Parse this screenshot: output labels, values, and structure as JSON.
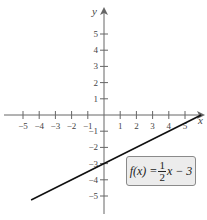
{
  "chart_data": {
    "type": "line",
    "title": "",
    "xlabel": "x",
    "ylabel": "y",
    "xlim": [
      -5,
      6
    ],
    "ylim": [
      -5,
      6
    ],
    "grid": false,
    "x_ticks": [
      -5,
      -4,
      -3,
      -2,
      -1,
      1,
      2,
      3,
      4,
      5
    ],
    "y_ticks": [
      -5,
      -4,
      -3,
      -2,
      -1,
      1,
      2,
      3,
      4,
      5
    ],
    "x_tick_labels": [
      "−5",
      "−4",
      "−3",
      "−2",
      "−1",
      "1",
      "2",
      "3",
      "4",
      "5"
    ],
    "y_tick_labels": [
      "−5",
      "−4",
      "−3",
      "−2",
      "−1",
      "1",
      "2",
      "3",
      "4",
      "5"
    ],
    "series": [
      {
        "name": "f(x) = 1/2 x − 3",
        "slope": 0.5,
        "intercept": -3,
        "x": [
          -4.5,
          6
        ],
        "y": [
          -5.25,
          0
        ],
        "color": "#111111"
      }
    ],
    "annotations": [
      {
        "text": "f(x) = 1/2 x − 3",
        "position": "lower-right"
      }
    ]
  },
  "equation": {
    "lhs": "f(x) =",
    "num": "1",
    "den": "2",
    "rhs": "x − 3"
  },
  "axes": {
    "x_label": "x",
    "y_label": "y"
  },
  "colors": {
    "axis": "#555555",
    "line": "#111111",
    "box_fill": "#ececec",
    "box_border": "#8a8a8a"
  }
}
